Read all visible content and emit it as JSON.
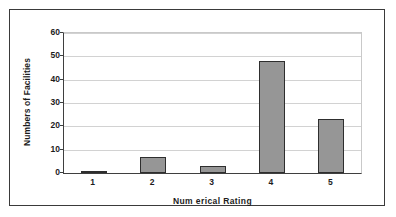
{
  "chart_data": {
    "type": "bar",
    "title": "",
    "subtitle": "",
    "xlabel": "Num erical Rating",
    "ylabel": "Numbers of Facilities",
    "categories": [
      "1",
      "2",
      "3",
      "4",
      "5"
    ],
    "values": [
      1,
      7,
      3,
      48,
      23
    ],
    "ylim": [
      0,
      60
    ],
    "ytick_labels": [
      "0",
      "10",
      "20",
      "30",
      "40",
      "50",
      "60"
    ],
    "ytick_values": [
      0,
      10,
      20,
      30,
      40,
      50,
      60
    ],
    "grid": "horizontal",
    "legend": "none",
    "annotations": [],
    "series": [
      {
        "name": "Numbers of Facilities",
        "values": [
          1,
          7,
          3,
          48,
          23
        ]
      }
    ]
  },
  "style": {
    "bar_fill": "#969696",
    "bar_border": "#2e2e2e",
    "gridline_color": "#d2d2d2",
    "axis_color": "#3f3f3f",
    "frame_border": "#3a3a3a",
    "background": "#ffffff",
    "text_color": "#1c1c1c"
  }
}
